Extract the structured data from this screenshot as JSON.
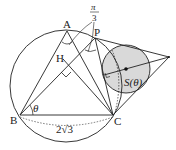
{
  "diagram": {
    "points": {
      "A": {
        "label": "A",
        "x": 67,
        "y": 31
      },
      "P": {
        "label": "P",
        "x": 95,
        "y": 38
      },
      "H": {
        "label": "H",
        "x": 63,
        "y": 59
      },
      "B": {
        "label": "B",
        "x": 20,
        "y": 115
      },
      "C": {
        "label": "C",
        "x": 113,
        "y": 115
      },
      "T": {
        "x": 169,
        "y": 57
      }
    },
    "circle_main": {
      "cx": 66,
      "cy": 86,
      "r": 56
    },
    "circle_small": {
      "cx": 126,
      "cy": 69,
      "r": 24,
      "fill": "#d9d9d9"
    },
    "labels": {
      "theta": "θ",
      "pi_num": "π",
      "pi_den": "3",
      "base": "2√3",
      "area": "S(θ)"
    },
    "colors": {
      "stroke": "#222222",
      "shade": "#d9d9d9"
    }
  }
}
